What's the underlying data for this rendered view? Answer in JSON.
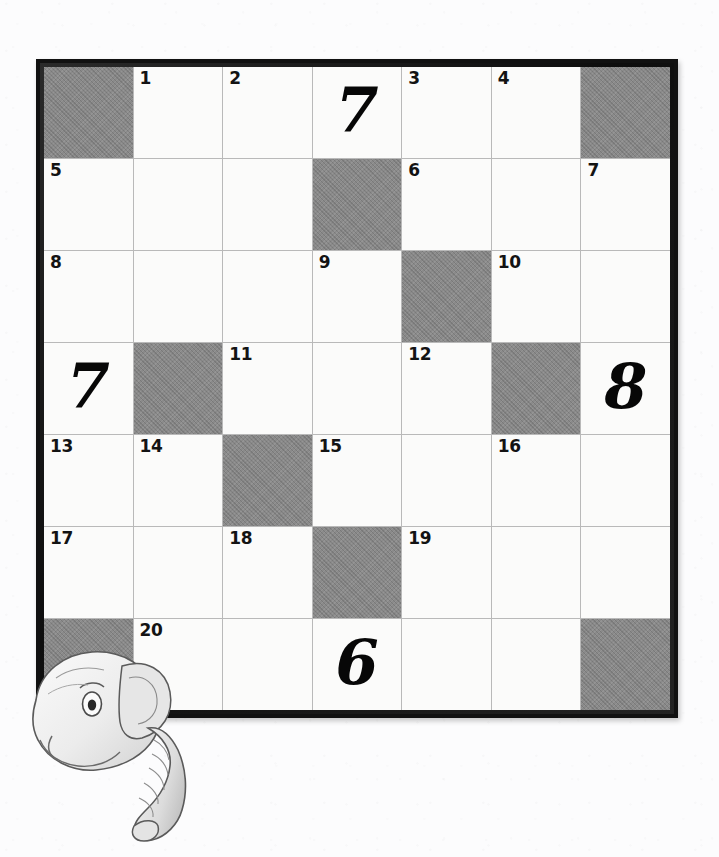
{
  "page": {
    "type": "crossword-puzzle-grid",
    "background_color": "#fcfcfd"
  },
  "grid": {
    "rows": 7,
    "columns": 7,
    "border_color": "#111111",
    "cell_color": "#fbfbfa",
    "shaded_color": "#8a8a8a",
    "gridline_color": "#b9b9b9",
    "cells": [
      [
        {
          "shaded": true,
          "clue": "",
          "answer": ""
        },
        {
          "shaded": false,
          "clue": "1",
          "answer": ""
        },
        {
          "shaded": false,
          "clue": "2",
          "answer": ""
        },
        {
          "shaded": false,
          "clue": "",
          "answer": "7"
        },
        {
          "shaded": false,
          "clue": "3",
          "answer": ""
        },
        {
          "shaded": false,
          "clue": "4",
          "answer": ""
        },
        {
          "shaded": true,
          "clue": "",
          "answer": ""
        }
      ],
      [
        {
          "shaded": false,
          "clue": "5",
          "answer": ""
        },
        {
          "shaded": false,
          "clue": "",
          "answer": ""
        },
        {
          "shaded": false,
          "clue": "",
          "answer": ""
        },
        {
          "shaded": true,
          "clue": "",
          "answer": ""
        },
        {
          "shaded": false,
          "clue": "6",
          "answer": ""
        },
        {
          "shaded": false,
          "clue": "",
          "answer": ""
        },
        {
          "shaded": false,
          "clue": "7",
          "answer": ""
        }
      ],
      [
        {
          "shaded": false,
          "clue": "8",
          "answer": ""
        },
        {
          "shaded": false,
          "clue": "",
          "answer": ""
        },
        {
          "shaded": false,
          "clue": "",
          "answer": ""
        },
        {
          "shaded": false,
          "clue": "9",
          "answer": ""
        },
        {
          "shaded": true,
          "clue": "",
          "answer": ""
        },
        {
          "shaded": false,
          "clue": "10",
          "answer": ""
        },
        {
          "shaded": false,
          "clue": "",
          "answer": ""
        }
      ],
      [
        {
          "shaded": false,
          "clue": "",
          "answer": "7"
        },
        {
          "shaded": true,
          "clue": "",
          "answer": ""
        },
        {
          "shaded": false,
          "clue": "11",
          "answer": ""
        },
        {
          "shaded": false,
          "clue": "",
          "answer": ""
        },
        {
          "shaded": false,
          "clue": "12",
          "answer": ""
        },
        {
          "shaded": true,
          "clue": "",
          "answer": ""
        },
        {
          "shaded": false,
          "clue": "",
          "answer": "8"
        }
      ],
      [
        {
          "shaded": false,
          "clue": "13",
          "answer": ""
        },
        {
          "shaded": false,
          "clue": "14",
          "answer": ""
        },
        {
          "shaded": true,
          "clue": "",
          "answer": ""
        },
        {
          "shaded": false,
          "clue": "15",
          "answer": ""
        },
        {
          "shaded": false,
          "clue": "",
          "answer": ""
        },
        {
          "shaded": false,
          "clue": "16",
          "answer": ""
        },
        {
          "shaded": false,
          "clue": "",
          "answer": ""
        }
      ],
      [
        {
          "shaded": false,
          "clue": "17",
          "answer": ""
        },
        {
          "shaded": false,
          "clue": "",
          "answer": ""
        },
        {
          "shaded": false,
          "clue": "18",
          "answer": ""
        },
        {
          "shaded": true,
          "clue": "",
          "answer": ""
        },
        {
          "shaded": false,
          "clue": "19",
          "answer": ""
        },
        {
          "shaded": false,
          "clue": "",
          "answer": ""
        },
        {
          "shaded": false,
          "clue": "",
          "answer": ""
        }
      ],
      [
        {
          "shaded": true,
          "clue": "",
          "answer": ""
        },
        {
          "shaded": false,
          "clue": "20",
          "answer": ""
        },
        {
          "shaded": false,
          "clue": "",
          "answer": ""
        },
        {
          "shaded": false,
          "clue": "",
          "answer": "6"
        },
        {
          "shaded": false,
          "clue": "",
          "answer": ""
        },
        {
          "shaded": false,
          "clue": "",
          "answer": ""
        },
        {
          "shaded": true,
          "clue": "",
          "answer": ""
        }
      ]
    ]
  },
  "illustration": {
    "subject": "elephant-head-peeking",
    "position": "bottom-left-behind-grid",
    "line_color": "#555555",
    "fill_color": "#f2f2f2",
    "shade_color": "#cfcfcf"
  }
}
